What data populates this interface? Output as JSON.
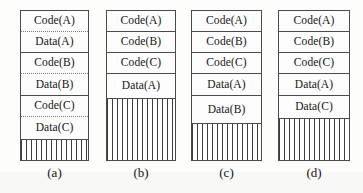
{
  "figure": {
    "background_color": "#fdfdfb",
    "line_color": "#4a4a4a",
    "hatch_color": "#3d3d3d",
    "diagrams": [
      {
        "id": "a",
        "caption": "(a)",
        "left": 20,
        "top": 10,
        "width": 69,
        "height": 151,
        "caption_top": 166,
        "segments": [
          {
            "label": "Code(A)",
            "height": 21,
            "separator": "dotted"
          },
          {
            "label": "Data(A)",
            "height": 21,
            "separator": "solid"
          },
          {
            "label": "Code(B)",
            "height": 21,
            "separator": "dotted"
          },
          {
            "label": "Data(B)",
            "height": 22,
            "separator": "solid"
          },
          {
            "label": "Code(C)",
            "height": 21,
            "separator": "dotted"
          },
          {
            "label": "Data(C)",
            "height": 22,
            "separator": "none"
          }
        ],
        "free_height": 23
      },
      {
        "id": "b",
        "caption": "(b)",
        "left": 106,
        "top": 10,
        "width": 70,
        "height": 151,
        "caption_top": 166,
        "segments": [
          {
            "label": "Code(A)",
            "height": 21,
            "separator": "solid"
          },
          {
            "label": "Code(B)",
            "height": 21,
            "separator": "solid"
          },
          {
            "label": "Code(C)",
            "height": 21,
            "separator": "solid"
          },
          {
            "label": "Data(A)",
            "height": 24,
            "separator": "none"
          }
        ],
        "free_height": 64
      },
      {
        "id": "c",
        "caption": "(c)",
        "left": 191,
        "top": 10,
        "width": 71,
        "height": 151,
        "caption_top": 166,
        "segments": [
          {
            "label": "Code(A)",
            "height": 21,
            "separator": "solid"
          },
          {
            "label": "Code(B)",
            "height": 21,
            "separator": "solid"
          },
          {
            "label": "Code(C)",
            "height": 21,
            "separator": "solid"
          },
          {
            "label": "Data(A)",
            "height": 22,
            "separator": "solid"
          },
          {
            "label": "Data(B)",
            "height": 27,
            "separator": "none"
          }
        ],
        "free_height": 39
      },
      {
        "id": "d",
        "caption": "(d)",
        "left": 278,
        "top": 10,
        "width": 72,
        "height": 151,
        "caption_top": 166,
        "segments": [
          {
            "label": "Code(A)",
            "height": 21,
            "separator": "solid"
          },
          {
            "label": "Code(B)",
            "height": 21,
            "separator": "solid"
          },
          {
            "label": "Code(C)",
            "height": 21,
            "separator": "solid"
          },
          {
            "label": "Data(A)",
            "height": 22,
            "separator": "solid"
          },
          {
            "label": "Data(C)",
            "height": 22,
            "separator": "none"
          }
        ],
        "free_height": 44
      }
    ]
  }
}
